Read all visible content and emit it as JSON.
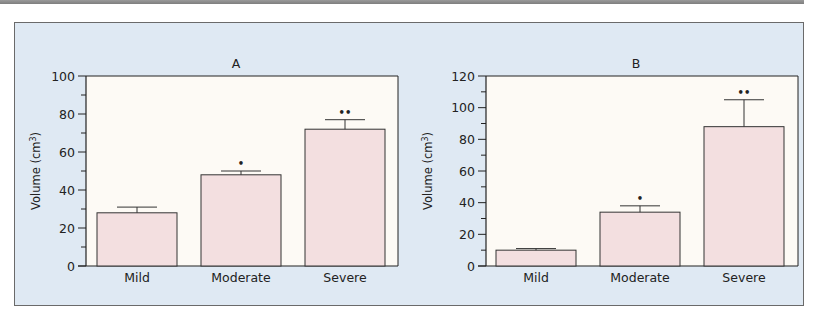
{
  "colors": {
    "panel_bg": "#dfe9f3",
    "plot_bg": "#fdfaf5",
    "bar_fill": "#f3dfe0",
    "axis": "#222222"
  },
  "chart_data": [
    {
      "type": "bar",
      "title": "A",
      "xlabel": "",
      "ylabel": "Volume (cm³)",
      "ylim": [
        0,
        100
      ],
      "yticks": [
        0,
        20,
        40,
        60,
        80,
        100
      ],
      "categories": [
        "Mild",
        "Moderate",
        "Severe"
      ],
      "values": [
        28,
        48,
        72
      ],
      "error_upper": [
        31,
        50,
        77
      ],
      "annotations": [
        "",
        "*",
        "**"
      ],
      "grid": false
    },
    {
      "type": "bar",
      "title": "B",
      "xlabel": "",
      "ylabel": "Volume (cm³)",
      "ylim": [
        0,
        120
      ],
      "yticks": [
        0,
        20,
        40,
        60,
        80,
        100,
        120
      ],
      "categories": [
        "Mild",
        "Moderate",
        "Severe"
      ],
      "values": [
        10,
        34,
        88
      ],
      "error_upper": [
        11,
        38,
        105
      ],
      "annotations": [
        "",
        "*",
        "**"
      ],
      "grid": false
    }
  ]
}
